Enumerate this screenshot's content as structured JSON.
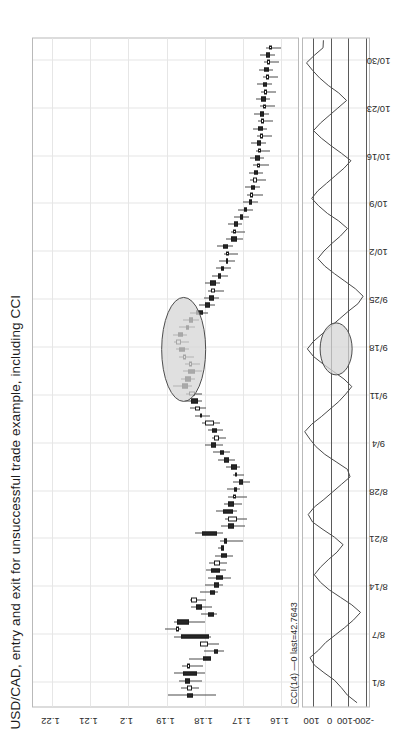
{
  "chart_data": {
    "type": "candlestick",
    "title": "USD/CAD, entry and exit for unsuccessful trade example, including CCI",
    "xlabel": "",
    "ylabel": "",
    "grid": true,
    "price_axis": {
      "ticks": [
        "1.22",
        "1.21",
        "1.2",
        "1.19",
        "1.18",
        "1.17",
        "1.16"
      ],
      "min": 1.155,
      "max": 1.225
    },
    "date_axis": {
      "ticks": [
        "8/1",
        "8/7",
        "8/14",
        "8/21",
        "8/28",
        "9/4",
        "9/11",
        "9/18",
        "9/25",
        "10/2",
        "10/9",
        "10/16",
        "10/23",
        "10/30"
      ]
    },
    "indicator": {
      "name": "CCI(14)",
      "legend": "CCI(14) —0 last=42.7643",
      "last_value": 42.7643,
      "period": 14,
      "axis_ticks": [
        "100",
        "0",
        "-100",
        "-200"
      ],
      "levels": [
        100,
        0,
        -100,
        -200
      ],
      "values": [
        -150,
        -95,
        -60,
        -20,
        40,
        95,
        120,
        70,
        30,
        -25,
        -80,
        -130,
        -170,
        -120,
        -55,
        10,
        60,
        95,
        60,
        15,
        -35,
        -70,
        -20,
        45,
        105,
        130,
        95,
        40,
        -10,
        -60,
        -110,
        -95,
        -30,
        35,
        85,
        120,
        150,
        110,
        55,
        5,
        -45,
        -85,
        -120,
        -75,
        -15,
        45,
        100,
        135,
        100,
        50,
        0,
        -50,
        -100,
        -155,
        -185,
        -140,
        -80,
        -20,
        35,
        75,
        40,
        -5,
        -55,
        -95,
        -45,
        20,
        70,
        110,
        75,
        25,
        -25,
        -75,
        -115,
        -60,
        0,
        55,
        100,
        60,
        10,
        -40,
        -90,
        -45,
        15,
        65,
        105,
        140,
        95,
        45,
        43
      ]
    },
    "annotations": [
      {
        "name": "entry-exit-highlight-price",
        "label": "",
        "shape": "ellipse"
      },
      {
        "name": "entry-exit-highlight-cci",
        "label": "",
        "shape": "ellipse"
      }
    ],
    "candles": [
      {
        "o": 1.1845,
        "h": 1.1895,
        "l": 1.177,
        "c": 1.183
      },
      {
        "o": 1.1833,
        "h": 1.1862,
        "l": 1.1815,
        "c": 1.1846
      },
      {
        "o": 1.1852,
        "h": 1.1868,
        "l": 1.1806,
        "c": 1.1838
      },
      {
        "o": 1.1858,
        "h": 1.188,
        "l": 1.1798,
        "c": 1.182
      },
      {
        "o": 1.1838,
        "h": 1.186,
        "l": 1.1805,
        "c": 1.1846
      },
      {
        "o": 1.1805,
        "h": 1.1841,
        "l": 1.1788,
        "c": 1.1784
      },
      {
        "o": 1.1776,
        "h": 1.1802,
        "l": 1.175,
        "c": 1.1766
      },
      {
        "o": 1.1792,
        "h": 1.1806,
        "l": 1.1762,
        "c": 1.1812
      },
      {
        "o": 1.1862,
        "h": 1.188,
        "l": 1.1784,
        "c": 1.1788
      },
      {
        "o": 1.1868,
        "h": 1.1905,
        "l": 1.1862,
        "c": 1.1874
      },
      {
        "o": 1.1872,
        "h": 1.188,
        "l": 1.1798,
        "c": 1.184
      },
      {
        "o": 1.1792,
        "h": 1.181,
        "l": 1.1768,
        "c": 1.1776
      },
      {
        "o": 1.1822,
        "h": 1.1836,
        "l": 1.1782,
        "c": 1.1808
      },
      {
        "o": 1.182,
        "h": 1.1838,
        "l": 1.1796,
        "c": 1.1835
      },
      {
        "o": 1.1786,
        "h": 1.1812,
        "l": 1.1766,
        "c": 1.1772
      },
      {
        "o": 1.1776,
        "h": 1.1798,
        "l": 1.1752,
        "c": 1.1762
      },
      {
        "o": 1.177,
        "h": 1.179,
        "l": 1.1732,
        "c": 1.1752
      },
      {
        "o": 1.1784,
        "h": 1.1796,
        "l": 1.1744,
        "c": 1.176
      },
      {
        "o": 1.176,
        "h": 1.1788,
        "l": 1.1742,
        "c": 1.1776
      },
      {
        "o": 1.1756,
        "h": 1.1772,
        "l": 1.1726,
        "c": 1.1742
      },
      {
        "o": 1.1756,
        "h": 1.1766,
        "l": 1.1748,
        "c": 1.1752
      },
      {
        "o": 1.1748,
        "h": 1.176,
        "l": 1.17,
        "c": 1.1744
      },
      {
        "o": 1.1806,
        "h": 1.1824,
        "l": 1.1752,
        "c": 1.1768
      },
      {
        "o": 1.174,
        "h": 1.1758,
        "l": 1.1694,
        "c": 1.1722
      },
      {
        "o": 1.1714,
        "h": 1.1746,
        "l": 1.1688,
        "c": 1.174
      },
      {
        "o": 1.1752,
        "h": 1.177,
        "l": 1.1716,
        "c": 1.1726
      },
      {
        "o": 1.1738,
        "h": 1.1748,
        "l": 1.1702,
        "c": 1.1722
      },
      {
        "o": 1.1718,
        "h": 1.174,
        "l": 1.169,
        "c": 1.1726
      },
      {
        "o": 1.1724,
        "h": 1.1742,
        "l": 1.1706,
        "c": 1.1714
      },
      {
        "o": 1.171,
        "h": 1.1726,
        "l": 1.168,
        "c": 1.17
      },
      {
        "o": 1.1716,
        "h": 1.1726,
        "l": 1.1696,
        "c": 1.172
      },
      {
        "o": 1.1732,
        "h": 1.1744,
        "l": 1.1706,
        "c": 1.1716
      },
      {
        "o": 1.1748,
        "h": 1.1766,
        "l": 1.172,
        "c": 1.1736
      },
      {
        "o": 1.176,
        "h": 1.1778,
        "l": 1.1734,
        "c": 1.1748
      },
      {
        "o": 1.1784,
        "h": 1.1798,
        "l": 1.1752,
        "c": 1.177
      },
      {
        "o": 1.1762,
        "h": 1.178,
        "l": 1.1744,
        "c": 1.1776
      },
      {
        "o": 1.178,
        "h": 1.1792,
        "l": 1.1752,
        "c": 1.1768
      },
      {
        "o": 1.1776,
        "h": 1.1806,
        "l": 1.176,
        "c": 1.18
      },
      {
        "o": 1.1806,
        "h": 1.1824,
        "l": 1.1786,
        "c": 1.1812
      },
      {
        "o": 1.1812,
        "h": 1.1838,
        "l": 1.1796,
        "c": 1.1826
      },
      {
        "o": 1.1836,
        "h": 1.1852,
        "l": 1.1806,
        "c": 1.1818
      },
      {
        "o": 1.1826,
        "h": 1.1848,
        "l": 1.1808,
        "c": 1.184
      },
      {
        "o": 1.186,
        "h": 1.1884,
        "l": 1.1832,
        "c": 1.1844
      },
      {
        "o": 1.1852,
        "h": 1.1862,
        "l": 1.1824,
        "c": 1.1836
      },
      {
        "o": 1.1844,
        "h": 1.1858,
        "l": 1.1806,
        "c": 1.1824
      },
      {
        "o": 1.1834,
        "h": 1.1852,
        "l": 1.1812,
        "c": 1.1842
      },
      {
        "o": 1.1848,
        "h": 1.1868,
        "l": 1.1828,
        "c": 1.1858
      },
      {
        "o": 1.1866,
        "h": 1.1876,
        "l": 1.1842,
        "c": 1.1852
      },
      {
        "o": 1.1862,
        "h": 1.188,
        "l": 1.184,
        "c": 1.1874
      },
      {
        "o": 1.187,
        "h": 1.1882,
        "l": 1.1846,
        "c": 1.1856
      },
      {
        "o": 1.185,
        "h": 1.1866,
        "l": 1.1826,
        "c": 1.184
      },
      {
        "o": 1.1842,
        "h": 1.1856,
        "l": 1.1814,
        "c": 1.183
      },
      {
        "o": 1.1822,
        "h": 1.1838,
        "l": 1.179,
        "c": 1.1804
      },
      {
        "o": 1.1798,
        "h": 1.1816,
        "l": 1.1772,
        "c": 1.1786
      },
      {
        "o": 1.1788,
        "h": 1.1802,
        "l": 1.1762,
        "c": 1.1776
      },
      {
        "o": 1.1772,
        "h": 1.179,
        "l": 1.1748,
        "c": 1.1784
      },
      {
        "o": 1.1786,
        "h": 1.1798,
        "l": 1.176,
        "c": 1.177
      },
      {
        "o": 1.1764,
        "h": 1.1782,
        "l": 1.174,
        "c": 1.1756
      },
      {
        "o": 1.1756,
        "h": 1.177,
        "l": 1.1732,
        "c": 1.1748
      },
      {
        "o": 1.1744,
        "h": 1.1762,
        "l": 1.172,
        "c": 1.1738
      },
      {
        "o": 1.1736,
        "h": 1.175,
        "l": 1.1712,
        "c": 1.1744
      },
      {
        "o": 1.1752,
        "h": 1.1768,
        "l": 1.1726,
        "c": 1.1738
      },
      {
        "o": 1.173,
        "h": 1.1744,
        "l": 1.17,
        "c": 1.1716
      },
      {
        "o": 1.1718,
        "h": 1.1732,
        "l": 1.1694,
        "c": 1.1726
      },
      {
        "o": 1.1722,
        "h": 1.1738,
        "l": 1.1702,
        "c": 1.1712
      },
      {
        "o": 1.1708,
        "h": 1.1722,
        "l": 1.1684,
        "c": 1.17
      },
      {
        "o": 1.1696,
        "h": 1.1712,
        "l": 1.1672,
        "c": 1.1688
      },
      {
        "o": 1.1684,
        "h": 1.17,
        "l": 1.166,
        "c": 1.1676
      },
      {
        "o": 1.1672,
        "h": 1.1688,
        "l": 1.1648,
        "c": 1.1682
      },
      {
        "o": 1.1678,
        "h": 1.1694,
        "l": 1.1654,
        "c": 1.1668
      },
      {
        "o": 1.1664,
        "h": 1.168,
        "l": 1.164,
        "c": 1.1672
      },
      {
        "o": 1.167,
        "h": 1.1684,
        "l": 1.1646,
        "c": 1.166
      },
      {
        "o": 1.1656,
        "h": 1.1672,
        "l": 1.1632,
        "c": 1.1664
      },
      {
        "o": 1.1668,
        "h": 1.1682,
        "l": 1.1644,
        "c": 1.1656
      },
      {
        "o": 1.1652,
        "h": 1.1666,
        "l": 1.1628,
        "c": 1.166
      },
      {
        "o": 1.1664,
        "h": 1.1678,
        "l": 1.164,
        "c": 1.1652
      },
      {
        "o": 1.1648,
        "h": 1.1664,
        "l": 1.1624,
        "c": 1.1656
      },
      {
        "o": 1.166,
        "h": 1.1674,
        "l": 1.1636,
        "c": 1.1648
      },
      {
        "o": 1.1644,
        "h": 1.166,
        "l": 1.162,
        "c": 1.1652
      },
      {
        "o": 1.1656,
        "h": 1.167,
        "l": 1.1632,
        "c": 1.1644
      },
      {
        "o": 1.164,
        "h": 1.1656,
        "l": 1.1616,
        "c": 1.1648
      },
      {
        "o": 1.1652,
        "h": 1.1666,
        "l": 1.1628,
        "c": 1.164
      },
      {
        "o": 1.1636,
        "h": 1.1652,
        "l": 1.1612,
        "c": 1.1644
      },
      {
        "o": 1.1648,
        "h": 1.1662,
        "l": 1.1624,
        "c": 1.1636
      },
      {
        "o": 1.1632,
        "h": 1.1648,
        "l": 1.1608,
        "c": 1.164
      },
      {
        "o": 1.1644,
        "h": 1.1658,
        "l": 1.162,
        "c": 1.1632
      },
      {
        "o": 1.1628,
        "h": 1.1644,
        "l": 1.1604,
        "c": 1.1636
      },
      {
        "o": 1.164,
        "h": 1.1654,
        "l": 1.1616,
        "c": 1.1628
      },
      {
        "o": 1.1624,
        "h": 1.164,
        "l": 1.16,
        "c": 1.1632
      }
    ]
  }
}
